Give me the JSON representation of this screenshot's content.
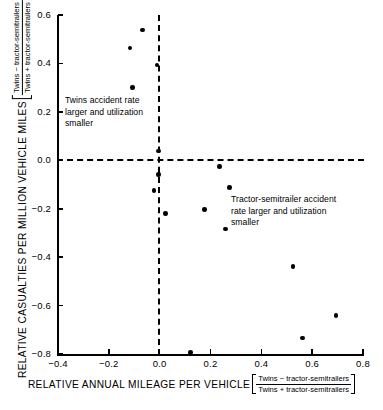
{
  "chart_data": {
    "type": "scatter",
    "title": "",
    "xlabel": "RELATIVE ANNUAL MILEAGE PER VEHICLE",
    "ylabel": "RELATIVE CASUALTIES PER MILLION VEHICLE MILES",
    "xlabel_fraction": {
      "numerator": "Twins  −  tractor-semitrailers",
      "denominator": "Twins  +  tractor-semitrailers"
    },
    "ylabel_fraction": {
      "numerator": "Twins  −  tractor-semitrailers",
      "denominator": "Twins  +  tractor-semitrailers"
    },
    "xlim": [
      -0.4,
      0.8
    ],
    "ylim": [
      -0.8,
      0.6
    ],
    "xticks": [
      -0.4,
      -0.2,
      0.0,
      0.2,
      0.4,
      0.6,
      0.8
    ],
    "yticks": [
      -0.8,
      -0.6,
      -0.4,
      -0.2,
      0.0,
      0.2,
      0.4,
      0.6
    ],
    "xticklabels": [
      "−0.4",
      "−0.2",
      "0.0",
      "0.2",
      "0.4",
      "0.6",
      "0.8"
    ],
    "yticklabels": [
      "−0.8",
      "−0.6",
      "−0.4",
      "−0.2",
      "0.0",
      "0.2",
      "0.4",
      "0.6"
    ],
    "grid": false,
    "legend": null,
    "reference_lines": [
      {
        "orientation": "horizontal",
        "value": 0.0,
        "style": "dashed"
      },
      {
        "orientation": "vertical",
        "value": -0.01,
        "style": "dashed"
      }
    ],
    "points": [
      {
        "x": -0.067,
        "y": 0.538
      },
      {
        "x": -0.117,
        "y": 0.464
      },
      {
        "x": -0.011,
        "y": 0.394
      },
      {
        "x": -0.108,
        "y": 0.301
      },
      {
        "x": -0.004,
        "y": 0.039
      },
      {
        "x": -0.004,
        "y": -0.059
      },
      {
        "x": -0.022,
        "y": -0.124
      },
      {
        "x": 0.236,
        "y": -0.025
      },
      {
        "x": 0.024,
        "y": -0.221
      },
      {
        "x": 0.274,
        "y": -0.113
      },
      {
        "x": 0.176,
        "y": -0.204
      },
      {
        "x": 0.258,
        "y": -0.283
      },
      {
        "x": 0.525,
        "y": -0.439
      },
      {
        "x": 0.693,
        "y": -0.642
      },
      {
        "x": 0.561,
        "y": -0.734
      },
      {
        "x": 0.121,
        "y": -0.795
      }
    ],
    "annotations": [
      {
        "id": "upper-left",
        "text": "Twins accident rate\nlarger and utilization\nsmaller",
        "quadrant": "upper-left"
      },
      {
        "id": "lower-right",
        "text": "Tractor-semitrailer accident\nrate larger and utilization\nsmaller",
        "quadrant": "lower-right"
      }
    ]
  }
}
